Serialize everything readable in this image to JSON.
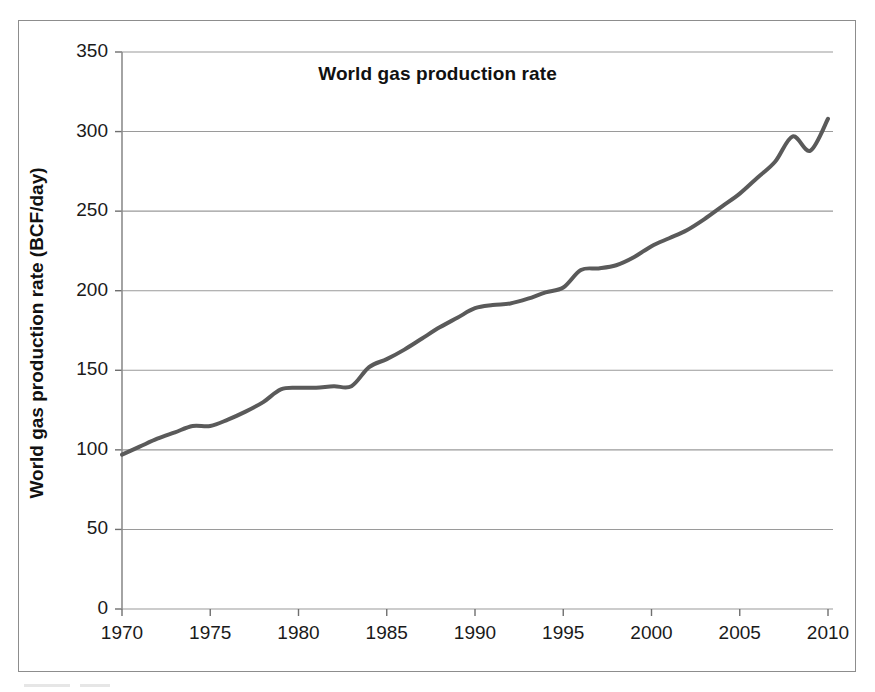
{
  "figure": {
    "title": "World gas production rate",
    "border_color": "#8d8d8d",
    "background": "#ffffff"
  },
  "chart_data": {
    "type": "line",
    "title": "World gas production rate",
    "xlabel": "",
    "ylabel": "World gas production rate (BCF/day)",
    "xlim": [
      1970,
      2010
    ],
    "ylim": [
      0,
      350
    ],
    "grid": true,
    "legend": "none",
    "line_color": "#5a5a5a",
    "line_width": 4,
    "x_ticks": [
      1970,
      1975,
      1980,
      1985,
      1990,
      1995,
      2000,
      2005,
      2010
    ],
    "y_ticks": [
      0,
      50,
      100,
      150,
      200,
      250,
      300,
      350
    ],
    "x_tick_labels": [
      "1970",
      "1975",
      "1980",
      "1985",
      "1990",
      "1995",
      "2000",
      "2005",
      "2010"
    ],
    "y_tick_labels": [
      "0",
      "50",
      "100",
      "150",
      "200",
      "250",
      "300",
      "350"
    ],
    "x": [
      1970,
      1971,
      1972,
      1973,
      1974,
      1975,
      1976,
      1977,
      1978,
      1979,
      1980,
      1981,
      1982,
      1983,
      1984,
      1985,
      1986,
      1987,
      1988,
      1989,
      1990,
      1991,
      1992,
      1993,
      1994,
      1995,
      1996,
      1997,
      1998,
      1999,
      2000,
      2001,
      2002,
      2003,
      2004,
      2005,
      2006,
      2007,
      2008,
      2009,
      2010
    ],
    "values": [
      97,
      102,
      107,
      111,
      115,
      115,
      119,
      124,
      130,
      138,
      139,
      139,
      140,
      140,
      152,
      157,
      163,
      170,
      177,
      183,
      189,
      191,
      192,
      195,
      199,
      202,
      213,
      214,
      216,
      221,
      228,
      233,
      238,
      245,
      253,
      261,
      271,
      281,
      297,
      288,
      308
    ]
  },
  "axes": {
    "y_title": "World gas production rate (BCF/day)"
  }
}
